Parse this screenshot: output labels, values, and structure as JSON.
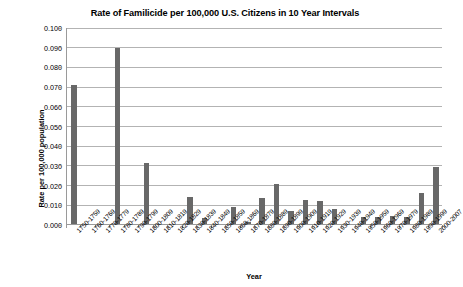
{
  "chart_data": {
    "type": "bar",
    "title": "Rate of Familicide per 100,000 U.S. Citizens in 10 Year Intervals",
    "xlabel": "Year",
    "ylabel": "Rate per 100,000 population",
    "ylim": [
      0.0,
      0.1
    ],
    "ytick_step": 0.01,
    "grid": true,
    "legend": "none",
    "bar_color": "#686868",
    "categories": [
      "1750-1759",
      "1760-1769",
      "1770-1779",
      "1780-1789",
      "1790-1799",
      "1800-1809",
      "1810-1819",
      "1820-1829",
      "1830-1839",
      "1840-1849",
      "1850-1859",
      "1860-1869",
      "1870-1879",
      "1880-1889",
      "1890-1899",
      "1900-1909",
      "1910-1919",
      "1920-1929",
      "1930-1939",
      "1940-1949",
      "1950-1959",
      "1960-1969",
      "1970-1979",
      "1980-1989",
      "1990-1999",
      "2000-2007"
    ],
    "values": [
      0.0705,
      0.0,
      0.0,
      0.0895,
      0.0,
      0.0312,
      0.0,
      0.0,
      0.0137,
      0.0032,
      0.0,
      0.0087,
      0.0012,
      0.0132,
      0.0205,
      0.0067,
      0.0124,
      0.0117,
      0.0077,
      0.0,
      0.0035,
      0.0037,
      0.0041,
      0.0038,
      0.0158,
      0.029
    ],
    "ytick_labels": [
      "0.000",
      "0.010",
      "0.020",
      "0.030",
      "0.040",
      "0.050",
      "0.060",
      "0.070",
      "0.080",
      "0.090",
      "0.100"
    ]
  }
}
